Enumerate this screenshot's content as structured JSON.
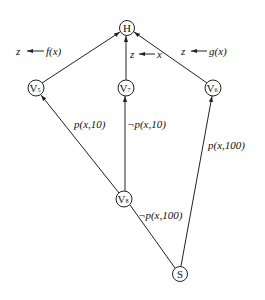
{
  "diagram": {
    "type": "directed-graph",
    "nodes": [
      {
        "id": "H",
        "label": "H",
        "sub": "",
        "x": 127,
        "y": 28
      },
      {
        "id": "V5",
        "label": "V",
        "sub": "5",
        "x": 36,
        "y": 88
      },
      {
        "id": "V7",
        "label": "V",
        "sub": "7",
        "x": 126,
        "y": 88
      },
      {
        "id": "V6",
        "label": "V",
        "sub": "6",
        "x": 213,
        "y": 88
      },
      {
        "id": "V8",
        "label": "V",
        "sub": "8",
        "x": 124,
        "y": 199
      },
      {
        "id": "S",
        "label": "S",
        "sub": "",
        "x": 180,
        "y": 274
      }
    ],
    "edges": [
      {
        "from": "V5",
        "to": "H",
        "label": ""
      },
      {
        "from": "V7",
        "to": "H",
        "label": ""
      },
      {
        "from": "V6",
        "to": "H",
        "label": ""
      },
      {
        "from": "V8",
        "to": "V5",
        "label": "p(x,10)"
      },
      {
        "from": "V8",
        "to": "V7",
        "label": "¬p(x,10)"
      },
      {
        "from": "S",
        "to": "V6",
        "label": "p(x,100)"
      },
      {
        "from": "S",
        "to": "V8",
        "label": "¬p(x,100)"
      }
    ],
    "annotations": {
      "v5_assign": {
        "lhs": "z",
        "rhs": "f(x)"
      },
      "v7_assign": {
        "lhs": "z",
        "rhs": "x"
      },
      "v6_assign": {
        "lhs": "z",
        "rhs": "g(x)"
      }
    },
    "edge_labels": {
      "v8_v5": "p(x,10)",
      "v8_v7": "¬p(x,10)",
      "s_v6": "p(x,100)",
      "s_v8": "¬p(x,100)"
    },
    "node_labels": {
      "H": "H",
      "V5": "V",
      "V5_sub": "5",
      "V7": "V",
      "V7_sub": "7",
      "V6": "V",
      "V6_sub": "6",
      "V8": "V",
      "V8_sub": "8",
      "S": "S"
    }
  }
}
